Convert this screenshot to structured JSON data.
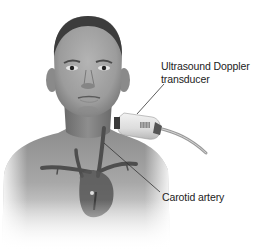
{
  "figure": {
    "style": "grayscale medical illustration",
    "colors": {
      "background": "#ffffff",
      "skin_light": "#c8c8c8",
      "skin_mid": "#9a9a9a",
      "skin_dark": "#6e6e6e",
      "vessel": "#4a4a4a",
      "label_text": "#222222",
      "leader_line": "#333333"
    }
  },
  "labels": {
    "transducer_line1": "Ultrasound Doppler",
    "transducer_line2": "transducer",
    "carotid": "Carotid artery"
  }
}
